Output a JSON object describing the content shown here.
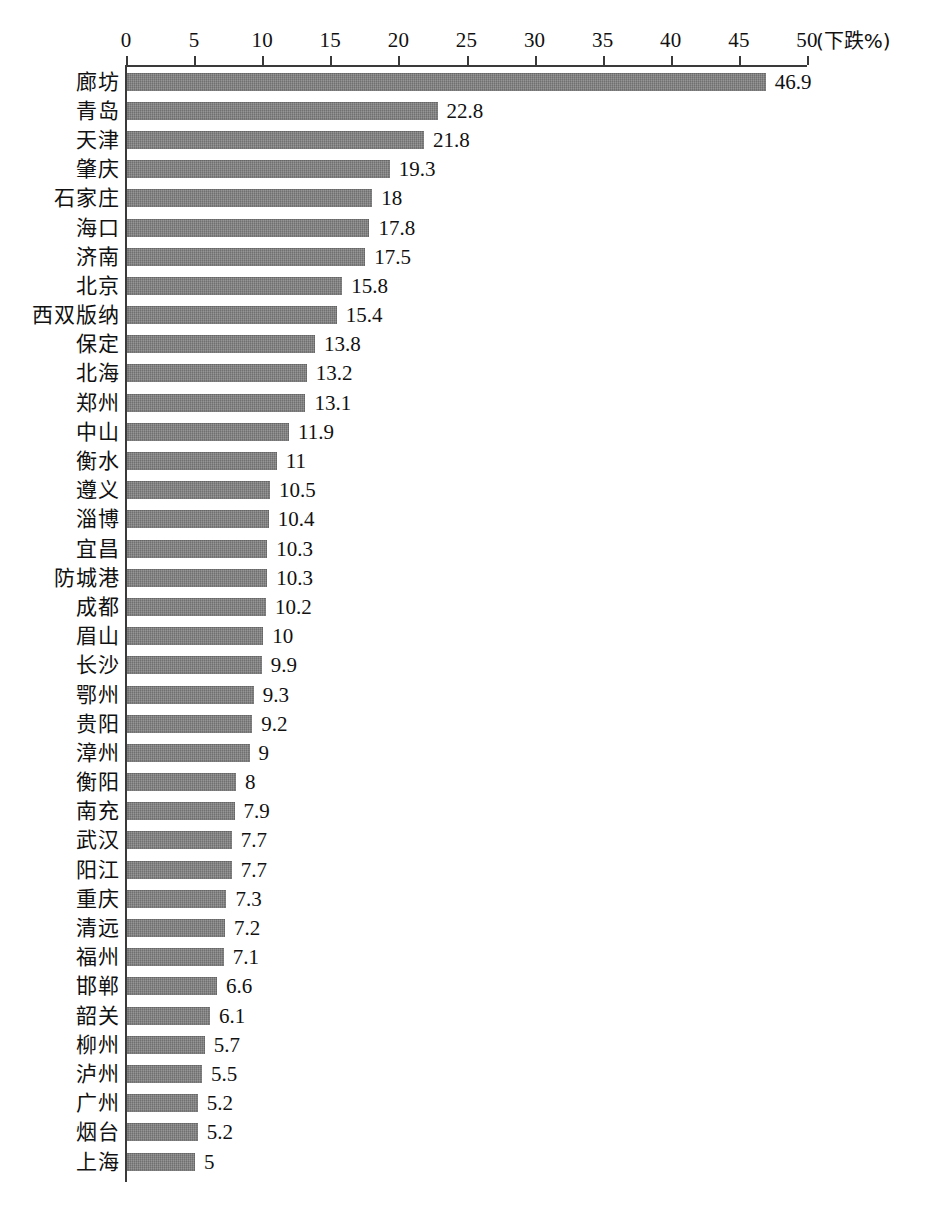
{
  "chart_data": {
    "type": "bar",
    "orientation": "horizontal",
    "title": "",
    "subtitle": "",
    "xlabel": "(下跌%)",
    "ylabel": "",
    "xlim": [
      0,
      50
    ],
    "xticks": [
      0,
      5,
      10,
      15,
      20,
      25,
      30,
      35,
      40,
      45,
      50
    ],
    "grid": false,
    "legend": null,
    "bar_color": "#7e7e7e",
    "axis_color": "#3a3a3a",
    "categories": [
      "廊坊",
      "青岛",
      "天津",
      "肇庆",
      "石家庄",
      "海口",
      "济南",
      "北京",
      "西双版纳",
      "保定",
      "北海",
      "郑州",
      "中山",
      "衡水",
      "遵义",
      "淄博",
      "宜昌",
      "防城港",
      "成都",
      "眉山",
      "长沙",
      "鄂州",
      "贵阳",
      "漳州",
      "衡阳",
      "南充",
      "武汉",
      "阳江",
      "重庆",
      "清远",
      "福州",
      "邯郸",
      "韶关",
      "柳州",
      "泸州",
      "广州",
      "烟台",
      "上海"
    ],
    "values": [
      46.9,
      22.8,
      21.8,
      19.3,
      18,
      17.8,
      17.5,
      15.8,
      15.4,
      13.8,
      13.2,
      13.1,
      11.9,
      11,
      10.5,
      10.4,
      10.3,
      10.3,
      10.2,
      10,
      9.9,
      9.3,
      9.2,
      9,
      8,
      7.9,
      7.7,
      7.7,
      7.3,
      7.2,
      7.1,
      6.6,
      6.1,
      5.7,
      5.5,
      5.2,
      5.2,
      5
    ],
    "value_labels": [
      "46.9",
      "22.8",
      "21.8",
      "19.3",
      "18",
      "17.8",
      "17.5",
      "15.8",
      "15.4",
      "13.8",
      "13.2",
      "13.1",
      "11.9",
      "11",
      "10.5",
      "10.4",
      "10.3",
      "10.3",
      "10.2",
      "10",
      "9.9",
      "9.3",
      "9.2",
      "9",
      "8",
      "7.9",
      "7.7",
      "7.7",
      "7.3",
      "7.2",
      "7.1",
      "6.6",
      "6.1",
      "5.7",
      "5.5",
      "5.2",
      "5.2",
      "5"
    ]
  },
  "caption": ""
}
